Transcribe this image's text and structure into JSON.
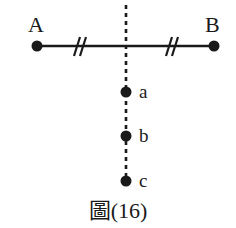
{
  "figure": {
    "caption": "圖(16)",
    "background_color": "#ffffff",
    "stroke_color": "#1a1a1a",
    "points": [
      {
        "id": "A",
        "label": "A",
        "x": 37,
        "y": 46,
        "label_x": 28,
        "label_y": 14,
        "radius": 5.5
      },
      {
        "id": "B",
        "label": "B",
        "x": 214,
        "y": 46,
        "label_x": 205,
        "label_y": 14,
        "radius": 5.5
      },
      {
        "id": "a",
        "label": "a",
        "x": 126,
        "y": 92,
        "label_x": 139,
        "label_y": 82,
        "radius": 5.5
      },
      {
        "id": "b",
        "label": "b",
        "x": 126,
        "y": 136,
        "label_x": 139,
        "label_y": 124,
        "radius": 5.5
      },
      {
        "id": "c",
        "label": "c",
        "x": 126,
        "y": 181,
        "label_x": 139,
        "label_y": 170,
        "radius": 5.5
      }
    ],
    "segments": [
      {
        "id": "segment-AB",
        "x1": 37,
        "y1": 46,
        "x2": 214,
        "y2": 46,
        "style": "solid",
        "width": 2.4
      }
    ],
    "dashed_lines": [
      {
        "id": "vertical-dashed-line",
        "x1": 126,
        "y1": 5,
        "x2": 126,
        "y2": 181,
        "style": "dashed",
        "width": 2.6,
        "dash": "4 4"
      }
    ],
    "tick_marks": [
      {
        "id": "tick-left",
        "center_x": 78,
        "center_y": 46,
        "count": 2,
        "spacing": 6,
        "half_height": 9,
        "slant": 4
      },
      {
        "id": "tick-right",
        "center_x": 170,
        "center_y": 46,
        "count": 2,
        "spacing": 6,
        "half_height": 9,
        "slant": 4
      }
    ]
  }
}
